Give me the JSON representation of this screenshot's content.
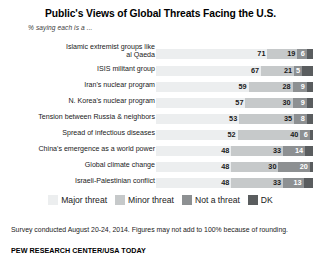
{
  "chart_data": {
    "type": "bar",
    "subtype": "stacked-horizontal-100",
    "title": "Public's Views of Global Threats Facing the U.S.",
    "subtitle": "% saying each is a ...",
    "xlabel": "",
    "ylabel": "",
    "xlim": [
      0,
      100
    ],
    "grid": false,
    "legend_position": "bottom",
    "categories": [
      "Islamic extremist groups like al Qaeda",
      "ISIS militant group",
      "Iran's nuclear program",
      "N. Korea's nuclear program",
      "Tension between Russia & neighbors",
      "Spread of infectious diseases",
      "China's emergence as a world power",
      "Global climate change",
      "Israeli-Palestinian conflict"
    ],
    "series": [
      {
        "name": "Major threat",
        "color": "#eceeef",
        "values": [
          71,
          67,
          59,
          57,
          53,
          52,
          48,
          48,
          48
        ]
      },
      {
        "name": "Minor threat",
        "color": "#c6c9ca",
        "values": [
          19,
          21,
          28,
          30,
          35,
          40,
          33,
          30,
          33
        ]
      },
      {
        "name": "Not a threat",
        "color": "#8d9092",
        "values": [
          6,
          5,
          9,
          9,
          8,
          6,
          14,
          20,
          13
        ]
      },
      {
        "name": "DK",
        "color": "#5a5d5f",
        "values": [
          4,
          7,
          4,
          4,
          4,
          2,
          5,
          2,
          6
        ]
      }
    ],
    "notes": "Survey conducted August 20-24, 2014. Figures may not add to 100% because of rounding.",
    "source": "PEW RESEARCH CENTER/USA TODAY"
  },
  "rows": [
    {
      "label_line1": "Islamic extremist groups like",
      "label_line2": "al Qaeda",
      "two_line": true,
      "major": "71",
      "minor": "19",
      "notthreat": "6",
      "dk": ""
    },
    {
      "label_line1": "ISIS militant group",
      "label_line2": "",
      "two_line": false,
      "major": "67",
      "minor": "21",
      "notthreat": "5",
      "dk": ""
    },
    {
      "label_line1": "Iran's nuclear program",
      "label_line2": "",
      "two_line": false,
      "major": "59",
      "minor": "28",
      "notthreat": "9",
      "dk": ""
    },
    {
      "label_line1": "N. Korea's nuclear program",
      "label_line2": "",
      "two_line": false,
      "major": "57",
      "minor": "30",
      "notthreat": "9",
      "dk": ""
    },
    {
      "label_line1": "Tension between Russia & neighbors",
      "label_line2": "",
      "two_line": false,
      "major": "53",
      "minor": "35",
      "notthreat": "8",
      "dk": ""
    },
    {
      "label_line1": "Spread of infectious diseases",
      "label_line2": "",
      "two_line": false,
      "major": "52",
      "minor": "40",
      "notthreat": "6",
      "dk": ""
    },
    {
      "label_line1": "China's emergence as a world power",
      "label_line2": "",
      "two_line": false,
      "major": "48",
      "minor": "33",
      "notthreat": "14",
      "dk": ""
    },
    {
      "label_line1": "Global climate change",
      "label_line2": "",
      "two_line": false,
      "major": "48",
      "minor": "30",
      "notthreat": "20",
      "dk": ""
    },
    {
      "label_line1": "Israeli-Palestinian conflict",
      "label_line2": "",
      "two_line": false,
      "major": "48",
      "minor": "33",
      "notthreat": "13",
      "dk": ""
    }
  ],
  "legend": [
    {
      "key": "major",
      "label": "Major threat",
      "color": "#eceeef"
    },
    {
      "key": "minor",
      "label": "Minor threat",
      "color": "#c6c9ca"
    },
    {
      "key": "notthreat",
      "label": "Not a threat",
      "color": "#8d9092"
    },
    {
      "key": "dk",
      "label": "DK",
      "color": "#5a5d5f"
    }
  ],
  "footnote": "Survey conducted August 20-24, 2014. Figures may not add to 100% because of rounding.",
  "source": "PEW RESEARCH CENTER/USA TODAY"
}
